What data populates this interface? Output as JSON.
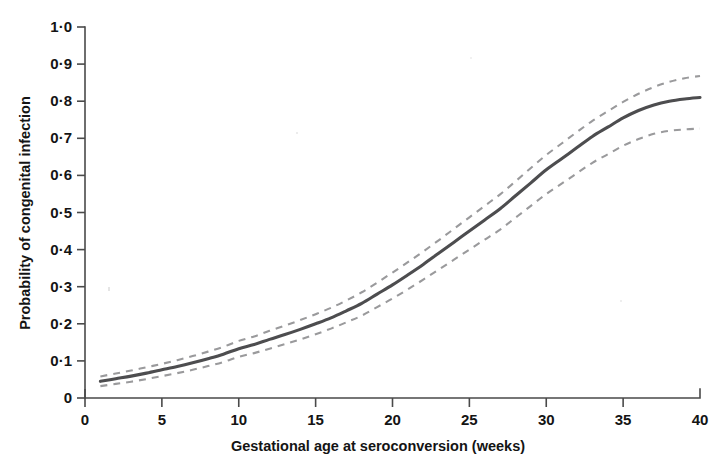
{
  "chart_data": {
    "type": "line",
    "title": "",
    "subtitle": "",
    "xlabel": "Gestational age at seroconversion (weeks)",
    "ylabel": "Probability of congenital infection",
    "xlim": [
      0,
      40
    ],
    "ylim": [
      0,
      1.0
    ],
    "grid": false,
    "legend": "none",
    "x_ticks": [
      0,
      5,
      10,
      15,
      20,
      25,
      30,
      35,
      40
    ],
    "x_tick_labels": [
      "0",
      "5",
      "10",
      "15",
      "20",
      "25",
      "30",
      "35",
      "40"
    ],
    "y_ticks": [
      0,
      0.1,
      0.2,
      0.3,
      0.4,
      0.5,
      0.6,
      0.7,
      0.8,
      0.9,
      1.0
    ],
    "y_tick_labels": [
      "0",
      "0·1",
      "0·2",
      "0·3",
      "0·4",
      "0·5",
      "0·6",
      "0·7",
      "0·8",
      "0·9",
      "1·0"
    ],
    "x": [
      1,
      2,
      3,
      4,
      5,
      6,
      7,
      8,
      9,
      10,
      11,
      12,
      13,
      14,
      15,
      16,
      17,
      18,
      19,
      20,
      21,
      22,
      23,
      24,
      25,
      26,
      27,
      28,
      29,
      30,
      31,
      32,
      33,
      34,
      35,
      36,
      37,
      38,
      39,
      40
    ],
    "series": [
      {
        "name": "Fitted probability of congenital infection",
        "style": "solid",
        "color": "#4d4d4f",
        "values": [
          0.045,
          0.052,
          0.059,
          0.067,
          0.076,
          0.085,
          0.095,
          0.106,
          0.118,
          0.133,
          0.144,
          0.158,
          0.171,
          0.185,
          0.2,
          0.216,
          0.235,
          0.255,
          0.28,
          0.305,
          0.332,
          0.36,
          0.39,
          0.42,
          0.45,
          0.48,
          0.51,
          0.545,
          0.58,
          0.615,
          0.645,
          0.675,
          0.705,
          0.73,
          0.755,
          0.775,
          0.79,
          0.8,
          0.806,
          0.81
        ]
      },
      {
        "name": "Upper 95% CI",
        "style": "dashed",
        "color": "#9a9a9c",
        "values": [
          0.058,
          0.066,
          0.074,
          0.083,
          0.092,
          0.102,
          0.113,
          0.125,
          0.138,
          0.154,
          0.166,
          0.181,
          0.195,
          0.21,
          0.226,
          0.243,
          0.263,
          0.285,
          0.311,
          0.338,
          0.366,
          0.395,
          0.425,
          0.456,
          0.487,
          0.518,
          0.549,
          0.584,
          0.62,
          0.655,
          0.686,
          0.717,
          0.747,
          0.773,
          0.798,
          0.82,
          0.838,
          0.852,
          0.862,
          0.868
        ]
      },
      {
        "name": "Lower 95% CI",
        "style": "dashed",
        "color": "#9a9a9c",
        "values": [
          0.032,
          0.038,
          0.044,
          0.051,
          0.059,
          0.067,
          0.076,
          0.086,
          0.097,
          0.111,
          0.121,
          0.133,
          0.145,
          0.158,
          0.172,
          0.187,
          0.204,
          0.222,
          0.245,
          0.268,
          0.293,
          0.319,
          0.346,
          0.373,
          0.4,
          0.427,
          0.454,
          0.486,
          0.518,
          0.55,
          0.578,
          0.606,
          0.634,
          0.657,
          0.68,
          0.698,
          0.712,
          0.72,
          0.724,
          0.726
        ]
      }
    ],
    "annotations": []
  },
  "figure": {
    "axis_color": "#4a4a4a",
    "line_color": "#4d4d4f",
    "ci_color": "#9a9a9c",
    "background": "#ffffff"
  }
}
